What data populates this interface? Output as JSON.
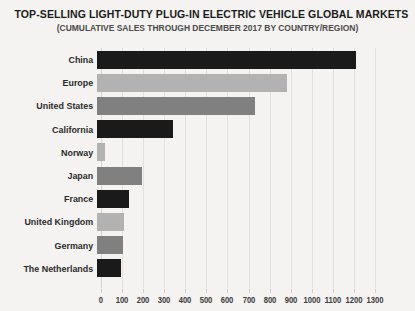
{
  "chart_data": {
    "type": "bar",
    "orientation": "horizontal",
    "title": "TOP-SELLING LIGHT-DUTY PLUG-IN ELECTRIC VEHICLE GLOBAL MARKETS",
    "subtitle": "(CUMULATIVE SALES THROUGH DECEMBER 2017 BY COUNTRY/REGION)",
    "xlabel": "",
    "ylabel": "",
    "xlim": [
      0,
      1300
    ],
    "xticks": [
      0,
      100,
      200,
      300,
      400,
      500,
      600,
      700,
      800,
      900,
      1000,
      1100,
      1200,
      1300
    ],
    "xtick_labels": [
      "0",
      "100",
      "200",
      "300",
      "400",
      "500",
      "600",
      "700",
      "800",
      "900",
      "1000",
      "1100",
      "1200",
      "1300"
    ],
    "grid": true,
    "legend": false,
    "categories": [
      "China",
      "Europe",
      "United States",
      "California",
      "Norway",
      "Japan",
      "France",
      "United Kingdom",
      "Germany",
      "The Netherlands"
    ],
    "values": [
      1230,
      900,
      750,
      360,
      40,
      215,
      150,
      130,
      125,
      115
    ],
    "bar_colors": [
      "#1a1a1a",
      "#b2b2b2",
      "#808080",
      "#1a1a1a",
      "#b2b2b2",
      "#808080",
      "#1a1a1a",
      "#b2b2b2",
      "#808080",
      "#1a1a1a"
    ],
    "background_color": "#f4f3f1",
    "gridline_color": "#e2e0dd"
  }
}
